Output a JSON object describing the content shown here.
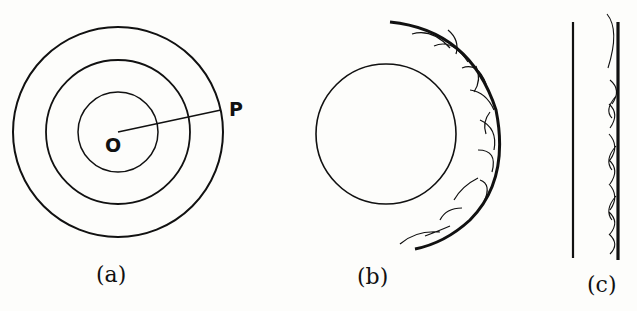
{
  "figure": {
    "panels": [
      {
        "id": "a",
        "caption": "(a)",
        "description": "Concentric circular wavefronts centered at point O with radius line to point P",
        "points": {
          "center_label": "O",
          "edge_label": "P"
        },
        "circles_radii_px": [
          40,
          72,
          105
        ]
      },
      {
        "id": "b",
        "caption": "(b)",
        "description": "Spherical wavefront with secondary wavelets forming the new wavefront envelope"
      },
      {
        "id": "c",
        "caption": "(c)",
        "description": "Plane wavefront with secondary wavelets forming the new plane wavefront"
      }
    ],
    "colors": {
      "ink": "#111111",
      "paper": "#fdfdfb"
    }
  }
}
